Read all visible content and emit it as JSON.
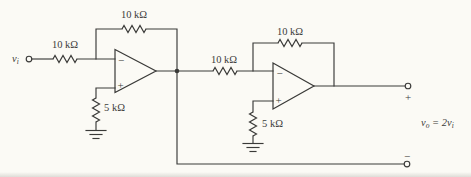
{
  "meta": {
    "colors": {
      "bg": "#fbfaf5",
      "line": "#3a3a38",
      "ink": "#3c3c3a"
    }
  },
  "input": {
    "var": "v",
    "sub": "i"
  },
  "resistors": {
    "input": "10 kΩ",
    "feedback1": "10 kΩ",
    "interstage": "10 kΩ",
    "feedback2": "10 kΩ",
    "ground1": "5 kΩ",
    "ground2": "5 kΩ"
  },
  "opamp1": {
    "inverting": "−",
    "noninverting": "+"
  },
  "opamp2": {
    "inverting": "−",
    "noninverting": "+"
  },
  "output": {
    "plus_terminal": "+",
    "minus_terminal": "−",
    "equation": {
      "v1": "v",
      "sub1": "o",
      "mid": " = 2",
      "v2": "v",
      "sub2": "i"
    }
  }
}
